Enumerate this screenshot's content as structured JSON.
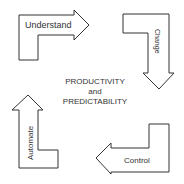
{
  "diagram": {
    "center": {
      "line1": "PRODUCTIVITY",
      "line2": "and",
      "line3": "PREDICTABILITY"
    },
    "arrows": [
      {
        "label": "Understand",
        "direction": "right",
        "position": "top-left"
      },
      {
        "label": "Change",
        "direction": "down",
        "position": "top-right"
      },
      {
        "label": "Control",
        "direction": "left",
        "position": "bottom-right"
      },
      {
        "label": "Automate",
        "direction": "up",
        "position": "bottom-left"
      }
    ],
    "colors": {
      "stroke": "#333333",
      "fill": "#ffffff",
      "text": "#333333"
    }
  }
}
